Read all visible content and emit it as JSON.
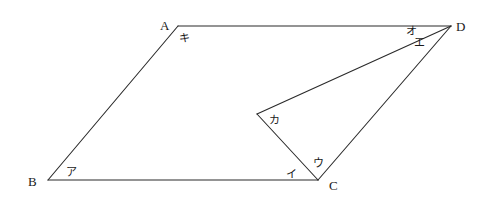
{
  "diagram": {
    "type": "parallelogram-with-interior-angle",
    "vertices": {
      "A": {
        "label": "A",
        "x": 178,
        "y": 26,
        "label_x": 160,
        "label_y": 30
      },
      "B": {
        "label": "B",
        "x": 48,
        "y": 180,
        "label_x": 28,
        "label_y": 186
      },
      "C": {
        "label": "C",
        "x": 318,
        "y": 180,
        "label_x": 329,
        "label_y": 190
      },
      "D": {
        "label": "D",
        "x": 451,
        "y": 26,
        "label_x": 456,
        "label_y": 31
      }
    },
    "interior_point": {
      "x": 257,
      "y": 114
    },
    "edges": [
      {
        "from": "A",
        "to": "D"
      },
      {
        "from": "A",
        "to": "B"
      },
      {
        "from": "B",
        "to": "C"
      },
      {
        "from": "C",
        "to": "D"
      },
      {
        "from": "D",
        "to": "P"
      },
      {
        "from": "P",
        "to": "C"
      }
    ],
    "angle_labels": [
      {
        "id": "a",
        "text": "ア",
        "x": 66,
        "y": 176
      },
      {
        "id": "i",
        "text": "イ",
        "x": 286,
        "y": 178
      },
      {
        "id": "u",
        "text": "ウ",
        "x": 313,
        "y": 167
      },
      {
        "id": "e",
        "text": "エ",
        "x": 414,
        "y": 46
      },
      {
        "id": "o",
        "text": "オ",
        "x": 406,
        "y": 35
      },
      {
        "id": "ka",
        "text": "カ",
        "x": 269,
        "y": 124
      },
      {
        "id": "ki",
        "text": "キ",
        "x": 179,
        "y": 42
      }
    ]
  }
}
